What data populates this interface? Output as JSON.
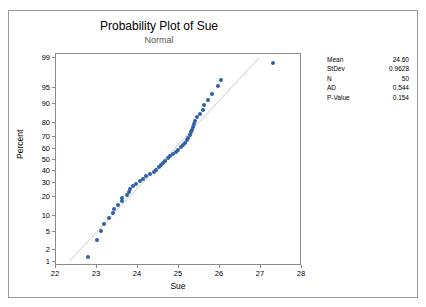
{
  "chart": {
    "title": "Probability Plot of Sue",
    "subtitle": "Normal",
    "xlabel": "Sue",
    "ylabel": "Percent"
  },
  "stats": {
    "rows": [
      {
        "key": "Mean",
        "value": "24.60"
      },
      {
        "key": "StDev",
        "value": "0.9628"
      },
      {
        "key": "N",
        "value": "50"
      },
      {
        "key": "AD",
        "value": "0.544"
      },
      {
        "key": "P-Value",
        "value": "0.154"
      }
    ]
  },
  "chart_data": {
    "type": "scatter",
    "title": "Probability Plot of Sue",
    "subtitle": "Normal",
    "xlabel": "Sue",
    "ylabel": "Percent",
    "xlim": [
      22,
      28
    ],
    "xticks": [
      22,
      23,
      24,
      25,
      26,
      27,
      28
    ],
    "yticks": [
      1,
      2,
      5,
      10,
      20,
      30,
      40,
      50,
      60,
      70,
      80,
      90,
      95,
      99
    ],
    "y_scale": "normal-probability",
    "grid": false,
    "fit_line": {
      "from": [
        22.35,
        1
      ],
      "to": [
        27.0,
        99
      ],
      "color": "#c9c9c9"
    },
    "marker_color": "#2f5fa8",
    "legend": "none",
    "annotations": [
      "Mean 24.60",
      "StDev 0.9628",
      "N 50",
      "AD 0.544",
      "P-Value 0.154"
    ],
    "points": [
      {
        "x": 22.78,
        "percent": 1.4
      },
      {
        "x": 23.0,
        "percent": 3.4
      },
      {
        "x": 23.1,
        "percent": 5.4
      },
      {
        "x": 23.18,
        "percent": 7.4
      },
      {
        "x": 23.3,
        "percent": 9.4
      },
      {
        "x": 23.4,
        "percent": 11.4
      },
      {
        "x": 23.42,
        "percent": 13.4
      },
      {
        "x": 23.5,
        "percent": 15.4
      },
      {
        "x": 23.6,
        "percent": 17.4
      },
      {
        "x": 23.62,
        "percent": 19.4
      },
      {
        "x": 23.72,
        "percent": 21.4
      },
      {
        "x": 23.78,
        "percent": 23.4
      },
      {
        "x": 23.8,
        "percent": 25.4
      },
      {
        "x": 23.88,
        "percent": 27.4
      },
      {
        "x": 23.95,
        "percent": 29.4
      },
      {
        "x": 24.05,
        "percent": 31.4
      },
      {
        "x": 24.12,
        "percent": 33.4
      },
      {
        "x": 24.2,
        "percent": 35.4
      },
      {
        "x": 24.3,
        "percent": 37.4
      },
      {
        "x": 24.38,
        "percent": 39.4
      },
      {
        "x": 24.45,
        "percent": 41.4
      },
      {
        "x": 24.5,
        "percent": 43.4
      },
      {
        "x": 24.55,
        "percent": 45.4
      },
      {
        "x": 24.6,
        "percent": 47.4
      },
      {
        "x": 24.65,
        "percent": 49.4
      },
      {
        "x": 24.72,
        "percent": 51.4
      },
      {
        "x": 24.78,
        "percent": 53.4
      },
      {
        "x": 24.85,
        "percent": 55.4
      },
      {
        "x": 24.92,
        "percent": 57.4
      },
      {
        "x": 24.98,
        "percent": 59.4
      },
      {
        "x": 25.05,
        "percent": 61.4
      },
      {
        "x": 25.1,
        "percent": 63.4
      },
      {
        "x": 25.15,
        "percent": 65.4
      },
      {
        "x": 25.2,
        "percent": 67.4
      },
      {
        "x": 25.22,
        "percent": 69.4
      },
      {
        "x": 25.28,
        "percent": 71.4
      },
      {
        "x": 25.3,
        "percent": 73.4
      },
      {
        "x": 25.32,
        "percent": 75.4
      },
      {
        "x": 25.34,
        "percent": 77.4
      },
      {
        "x": 25.36,
        "percent": 79.4
      },
      {
        "x": 25.4,
        "percent": 81.4
      },
      {
        "x": 25.45,
        "percent": 83.4
      },
      {
        "x": 25.52,
        "percent": 85.4
      },
      {
        "x": 25.58,
        "percent": 87.4
      },
      {
        "x": 25.62,
        "percent": 89.4
      },
      {
        "x": 25.7,
        "percent": 91.4
      },
      {
        "x": 25.8,
        "percent": 93.4
      },
      {
        "x": 25.95,
        "percent": 95.4
      },
      {
        "x": 26.02,
        "percent": 96.6
      },
      {
        "x": 27.3,
        "percent": 98.6
      }
    ]
  }
}
